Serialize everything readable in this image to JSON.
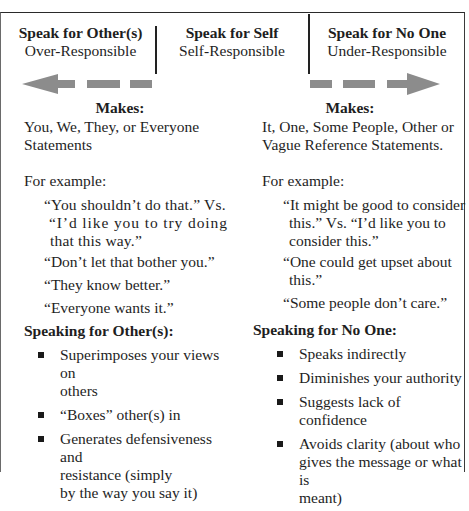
{
  "header": {
    "left": {
      "title": "Speak for Other(s)",
      "subtitle": "Over-Responsible"
    },
    "center": {
      "title": "Speak for Self",
      "subtitle": "Self-Responsible"
    },
    "right": {
      "title": "Speak for No One",
      "subtitle": "Under-Responsible"
    }
  },
  "arrows": {
    "left": {
      "direction": "left",
      "color": "#8c8c8c",
      "icon": "dashed-arrow-left-icon"
    },
    "right": {
      "direction": "right",
      "color": "#8c8c8c",
      "icon": "dashed-arrow-right-icon"
    }
  },
  "left_column": {
    "makes_label": "Makes:",
    "makes_lines": [
      "You, We, They, or Everyone",
      "Statements"
    ],
    "example_label": "For example:",
    "examples": [
      {
        "lines": [
          "“You shouldn’t do that.” Vs.",
          "“I’d like you to try doing",
          "that this way.”"
        ]
      },
      {
        "lines": [
          "“Don’t let that bother you.”"
        ]
      },
      {
        "lines": [
          "“They know better.”"
        ]
      },
      {
        "lines": [
          "“Everyone wants it.”"
        ]
      }
    ],
    "section_title": "Speaking for Other(s):",
    "bullets": [
      {
        "lines": [
          "Superimposes your views on",
          "others"
        ]
      },
      {
        "lines": [
          "“Boxes” other(s) in"
        ]
      },
      {
        "lines": [
          "Generates defensiveness and",
          "resistance (simply",
          "by the way you say it)"
        ]
      }
    ]
  },
  "right_column": {
    "makes_label": "Makes:",
    "makes_lines": [
      "It, One, Some People, Other or",
      "Vague Reference Statements."
    ],
    "example_label": "For example:",
    "examples": [
      {
        "lines": [
          "“It might be good to consider",
          "this.” Vs. “I’d like you to",
          "consider this.”"
        ]
      },
      {
        "lines": [
          "“One could get upset about",
          "this.”"
        ]
      },
      {
        "lines": [
          "“Some people don’t care.”"
        ]
      }
    ],
    "section_title": "Speaking for No One:",
    "bullets": [
      {
        "lines": [
          "Speaks indirectly"
        ]
      },
      {
        "lines": [
          "Diminishes your authority"
        ]
      },
      {
        "lines": [
          "Suggests lack of confidence"
        ]
      },
      {
        "lines": [
          "Avoids clarity (about who",
          "gives the message or what is",
          "meant)"
        ]
      }
    ]
  }
}
